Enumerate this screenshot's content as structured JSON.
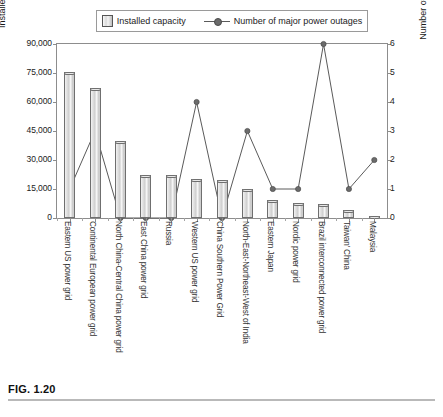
{
  "figure": {
    "caption": "FIG. 1.20"
  },
  "legend": {
    "items": [
      {
        "label": "Installed capacity",
        "marker": "bar-swatch"
      },
      {
        "label": "Number of major power outages",
        "marker": "line-marker"
      }
    ]
  },
  "axes": {
    "left_title": "Installed capacity (10 MW)",
    "right_title": "Number of major power outages",
    "left_ticks": [
      "0",
      "15,000",
      "30,000",
      "45,000",
      "60,000",
      "75,000",
      "90,000"
    ],
    "right_ticks": [
      "0",
      "1",
      "2",
      "3",
      "4",
      "5",
      "6"
    ]
  },
  "colors": {
    "bar_fill": "#d9d9d9",
    "bar_stroke": "#6f6f6f",
    "line": "#5a5a5a",
    "marker": "#6b6b6b",
    "frame": "#8d8d8d",
    "text": "#1a1a1a"
  },
  "chart_data": {
    "type": "bar",
    "title": "",
    "xlabel": "",
    "ylabel": "Installed capacity (10 MW)",
    "y2label": "Number of major power outages",
    "ylim": [
      0,
      90000
    ],
    "y2lim": [
      0,
      6
    ],
    "grid": false,
    "legend_position": "top-center",
    "categories": [
      "Eastern US power grid",
      "Continental European power grid",
      "North China-Central China power grid",
      "East China power grid",
      "Russia",
      "Western US power grid",
      "China Southern Power Grid",
      "North-East-Northeast-West of India",
      "Eastern Japan",
      "Nordic power grid",
      "Brazil interconnected power grid",
      "Taiwan' China",
      "Malaysia"
    ],
    "series": [
      {
        "name": "Installed capacity",
        "type": "bar",
        "axis": "left",
        "values": [
          75500,
          67500,
          40000,
          22000,
          22000,
          20000,
          19500,
          15000,
          9500,
          8000,
          7500,
          4000,
          1200
        ]
      },
      {
        "name": "Number of major power outages",
        "type": "line",
        "axis": "right",
        "values": [
          1,
          3,
          0,
          0,
          0,
          4,
          0,
          3,
          1,
          1,
          6,
          1,
          2
        ]
      }
    ]
  }
}
